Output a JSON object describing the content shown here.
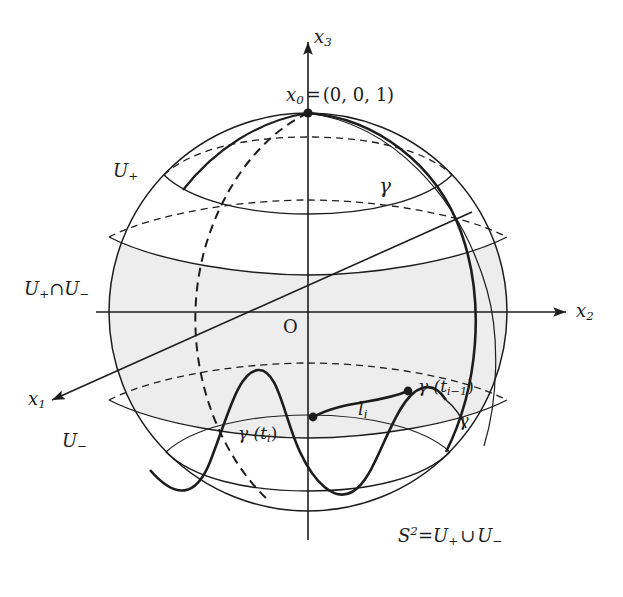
{
  "figure": {
    "domain_kind": "mathematical-diagram",
    "background_color": "#ffffff",
    "ink_color": "#1d1d1d",
    "shade_color": "#ededed"
  },
  "axes": {
    "x1": {
      "label_base": "x",
      "label_sub": "1"
    },
    "x2": {
      "label_base": "x",
      "label_sub": "2"
    },
    "x3": {
      "label_base": "x",
      "label_sub": "3"
    },
    "origin": {
      "label": "O"
    }
  },
  "points": {
    "north_pole": {
      "label_base": "x",
      "label_sub": "0",
      "equals": "=",
      "coordinates": "(0, 0, 1)"
    },
    "gamma_ti": {
      "label": "γ (t",
      "sub": "i",
      "close": ")"
    },
    "gamma_ti_minus_1": {
      "label": "γ (t",
      "sub": "i−1",
      "close": ")"
    }
  },
  "regions": {
    "u_plus": {
      "label_base": "U",
      "label_sub": "+"
    },
    "u_minus": {
      "label_base": "U",
      "label_sub": "−"
    },
    "u_intersection": {
      "left_base": "U",
      "left_sub": "+",
      "operator": "∩",
      "right_base": "U",
      "right_sub": "−"
    }
  },
  "curves": {
    "gamma": {
      "label": "γ"
    },
    "gamma_small": {
      "label": "γ"
    },
    "segment": {
      "label_base": "l",
      "label_sub": "i"
    }
  },
  "caption": {
    "sphere_symbol": "S",
    "sphere_exponent": "2",
    "equals": "=",
    "left_base": "U",
    "left_sub": "+",
    "operator": "∪",
    "right_base": "U",
    "right_sub": "−"
  }
}
